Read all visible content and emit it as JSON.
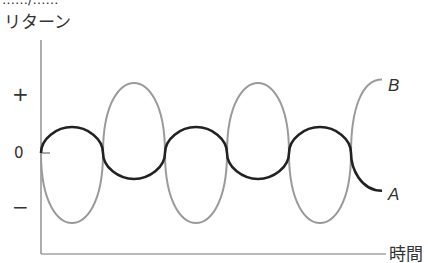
{
  "chart_data": {
    "type": "line",
    "title": "",
    "cropped_header_text": "……/……",
    "ylabel": "リターン",
    "xlabel": "時間",
    "y_ticks": [
      "+",
      "0",
      "−"
    ],
    "x_ticks": [],
    "grid": false,
    "legend_position": "inline-right",
    "x_range": [
      0,
      5.5
    ],
    "y_range": [
      -1,
      1
    ],
    "series": [
      {
        "name": "A",
        "label": "A",
        "color": "#222222",
        "description": "Low-amplitude oscillation around zero (small volatility)",
        "amplitude": 0.37,
        "phase": "starts at 0, rises first",
        "half_periods": 5.5,
        "end_side": "below zero"
      },
      {
        "name": "B",
        "label": "B",
        "color": "#9a9a9a",
        "description": "High-amplitude oscillation around zero, opposite phase to A (large volatility)",
        "amplitude": 1.0,
        "phase": "starts at 0, falls first",
        "half_periods": 5.5,
        "end_side": "above zero"
      }
    ]
  },
  "geometry": {
    "axis_x": 41,
    "baseline_y": 153,
    "half_period_px": 62,
    "amp_a_px": 26,
    "amp_b_px": 70,
    "x_axis_y": 254,
    "x_axis_end": 388,
    "y_axis_top": 40
  }
}
